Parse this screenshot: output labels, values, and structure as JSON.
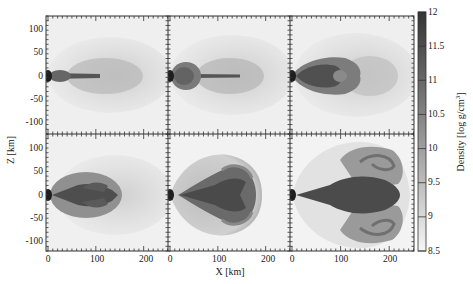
{
  "chart_data": {
    "type": "heatmap",
    "title": "",
    "layout": {
      "rows": 2,
      "cols": 3,
      "shared_axes": true
    },
    "xlabel": "X [km]",
    "ylabel": "Z [km]",
    "xlim": [
      0,
      250
    ],
    "ylim": [
      -125,
      125
    ],
    "x_ticks": [
      0,
      100,
      200
    ],
    "y_ticks": [
      100,
      50,
      0,
      -50,
      -100
    ],
    "colorbar": {
      "label": "Density [log g/cm^3]",
      "label_text": "Density [log g/cm",
      "label_sup": "3",
      "label_close": "]",
      "min": 8.5,
      "max": 12,
      "ticks": [
        12,
        11.5,
        11,
        10.5,
        10,
        9.5,
        9,
        8.5
      ],
      "tick_labels": [
        "12",
        "11.5",
        "11",
        "10.5",
        "10",
        "9.5",
        "9",
        "8.5"
      ],
      "colormap": "grayscale (dark = high density)",
      "color_high": "#333333",
      "color_low": "#f5f5f5"
    },
    "panels": [
      {
        "index": 0,
        "row": 0,
        "col": 0,
        "description": "narrow dense jet along x-axis with small lobe near origin; diffuse halo to ~200 km",
        "lobe_extent_km": 30
      },
      {
        "index": 1,
        "row": 0,
        "col": 1,
        "description": "spherical dense bubble near origin (~40 km), thin jet and diffuse halo",
        "lobe_extent_km": 40
      },
      {
        "index": 2,
        "row": 0,
        "col": 2,
        "description": "bullet-shaped dense lobe extending to ~110 km",
        "lobe_extent_km": 110
      },
      {
        "index": 3,
        "row": 1,
        "col": 0,
        "description": "ellipsoidal cocoon extending to ~145 km, dense core",
        "lobe_extent_km": 145
      },
      {
        "index": 4,
        "row": 1,
        "col": 1,
        "description": "large bow-shaped shell to ~210 km with forked dense interior",
        "lobe_extent_km": 210
      },
      {
        "index": 5,
        "row": 1,
        "col": 2,
        "description": "broad mushroom-shaped outflow to ~245 km with curled vortex lobes",
        "lobe_extent_km": 245
      }
    ]
  },
  "axes": {
    "x_tick_labels": [
      "0",
      "100",
      "200"
    ],
    "y_tick_labels": [
      "100",
      "50",
      "0",
      "-50",
      "-100"
    ]
  }
}
